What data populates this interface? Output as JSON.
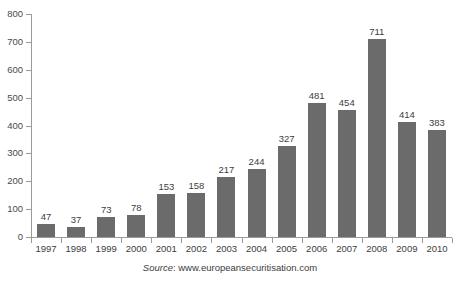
{
  "chart_data": {
    "type": "bar",
    "title": "",
    "xlabel": "",
    "ylabel": "",
    "ylim": [
      0,
      800
    ],
    "ytick_step": 100,
    "yticks": [
      0,
      100,
      200,
      300,
      400,
      500,
      600,
      700,
      800
    ],
    "grid": false,
    "legend": "none",
    "categories": [
      "1997",
      "1998",
      "1999",
      "2000",
      "2001",
      "2002",
      "2003",
      "2004",
      "2005",
      "2006",
      "2007",
      "2008",
      "2009",
      "2010"
    ],
    "values": [
      47,
      37,
      73,
      78,
      153,
      158,
      217,
      244,
      327,
      481,
      454,
      711,
      414,
      383
    ],
    "data_labels": [
      "47",
      "37",
      "73",
      "78",
      "153",
      "158",
      "217",
      "244",
      "327",
      "481",
      "454",
      "711",
      "414",
      "383"
    ],
    "bar_color": "#6b6b6b",
    "axis_color": "#9a9a9a",
    "text_color": "#3d3d3d"
  },
  "source": {
    "label": "Source",
    "separator": ": ",
    "url": "www.europeansecuritisation.com"
  }
}
